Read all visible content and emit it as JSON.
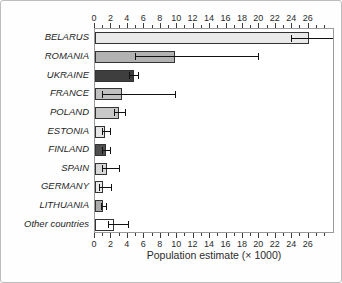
{
  "chart_data": {
    "type": "bar",
    "orientation": "horizontal",
    "title": "",
    "xlabel": "Population estimate (× 1000)",
    "ylabel": "",
    "xlim": [
      0,
      29.2
    ],
    "x_major_ticks": [
      0,
      2,
      4,
      6,
      8,
      10,
      12,
      14,
      16,
      18,
      20,
      22,
      24,
      26
    ],
    "x_minor_ticks": [
      1,
      3,
      5,
      7,
      9,
      11,
      13,
      15,
      17,
      19,
      21,
      23,
      25,
      27,
      28
    ],
    "grid": false,
    "legend": false,
    "axes_style": "box-with-top-and-bottom-ticks",
    "categories": [
      "BELARUS",
      "ROMANIA",
      "UKRAINE",
      "FRANCE",
      "POLAND",
      "ESTONIA",
      "FINLAND",
      "SPAIN",
      "GERMANY",
      "LITHUANIA",
      "Other countries"
    ],
    "values": [
      26,
      9.7,
      4.7,
      3.3,
      2.9,
      1.2,
      1.3,
      1.5,
      1.0,
      1.0,
      2.3
    ],
    "error_low": [
      23.9,
      4.9,
      4.1,
      0.9,
      2.3,
      0.8,
      0.9,
      0.8,
      0.5,
      0.7,
      1.6
    ],
    "error_high": [
      29.6,
      19.9,
      5.3,
      9.8,
      3.8,
      2.0,
      2.0,
      3.0,
      2.1,
      1.5,
      4.1
    ],
    "bar_colors": [
      "#e9e9e9",
      "#b2b2b2",
      "#3e3e3e",
      "#c0c0c0",
      "#c9c9c9",
      "#e6e6e6",
      "#4e4e4e",
      "#d7d7d7",
      "#eaeaea",
      "#ababab",
      "#ffffff"
    ],
    "bar_border_color": "#333333",
    "error_color": "#111111",
    "frame_color": "#9a9a9a",
    "tick_color": "#3c3c3c",
    "label_color": "#1f1f1f"
  }
}
